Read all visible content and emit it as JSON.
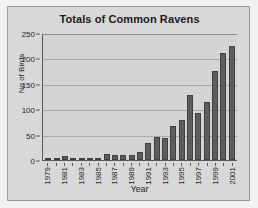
{
  "chart_data": {
    "type": "bar",
    "title": "Totals of Common Ravens",
    "xlabel": "Year",
    "ylabel": "No of Birds",
    "ylim": [
      0,
      250
    ],
    "yticks": [
      0,
      50,
      100,
      150,
      200,
      250
    ],
    "grid": true,
    "legend": null,
    "categories": [
      "1979",
      "1980",
      "1981",
      "1982",
      "1983",
      "1984",
      "1985",
      "1986",
      "1987",
      "1988",
      "1989",
      "1990",
      "1991",
      "1992",
      "1993",
      "1994",
      "1995",
      "1996",
      "1997",
      "1998",
      "1999",
      "2000",
      "2001"
    ],
    "tick_labels": [
      "1979",
      "",
      "1981",
      "",
      "1983",
      "",
      "1985",
      "",
      "1987",
      "",
      "1989",
      "",
      "1991",
      "",
      "1993",
      "",
      "1995",
      "",
      "1997",
      "",
      "1999",
      "",
      "2001"
    ],
    "values": [
      2,
      1,
      7,
      4,
      4,
      1,
      2,
      12,
      9,
      9,
      9,
      16,
      34,
      45,
      43,
      66,
      79,
      128,
      92,
      114,
      176,
      211,
      224
    ],
    "series_color": "#5d5d5d",
    "plot_background": "#d4d4d4",
    "figure_background": "#d8d8d8"
  }
}
